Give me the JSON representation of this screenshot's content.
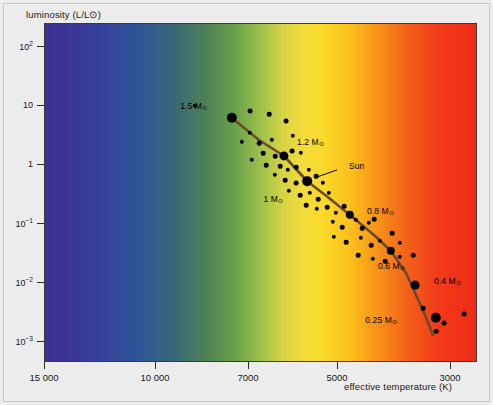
{
  "figure": {
    "y_axis_title": "luminosity (L/L⊙)",
    "x_axis_title": "effective temperature (K)"
  },
  "chart_data": {
    "type": "scatter",
    "title": "",
    "subtitle": "",
    "xlabel": "effective temperature (K)",
    "ylabel": "luminosity (L/L⊙)",
    "xscale": "log-reversed",
    "yscale": "log",
    "xlim": [
      15000,
      2600
    ],
    "ylim": [
      0.001,
      300
    ],
    "grid": false,
    "legend": null,
    "background": "stellar color spectrum gradient (blue hot -> red cool)",
    "xticks": [
      {
        "value": 15000,
        "label": "15 000"
      },
      {
        "value": 10000,
        "label": "10 000"
      },
      {
        "value": 7000,
        "label": "7000"
      },
      {
        "value": 5000,
        "label": "5000"
      },
      {
        "value": 3000,
        "label": "3000"
      }
    ],
    "yticks": [
      {
        "value": 100,
        "label": "10",
        "exponent": "2"
      },
      {
        "value": 10,
        "label": "10",
        "exponent": ""
      },
      {
        "value": 1,
        "label": "1",
        "exponent": ""
      },
      {
        "value": 0.1,
        "label": "10",
        "exponent": "−1"
      },
      {
        "value": 0.01,
        "label": "10",
        "exponent": "−2"
      },
      {
        "value": 0.001,
        "label": "10",
        "exponent": "−3"
      }
    ],
    "series": [
      {
        "name": "main sequence track",
        "type": "line",
        "color": "#6b4a2a",
        "points": [
          {
            "px": 188,
            "py": 95
          },
          {
            "px": 215,
            "py": 117
          },
          {
            "px": 240,
            "py": 133
          },
          {
            "px": 263,
            "py": 158
          },
          {
            "px": 285,
            "py": 175
          },
          {
            "px": 306,
            "py": 192
          },
          {
            "px": 330,
            "py": 212
          },
          {
            "px": 347,
            "py": 228
          },
          {
            "px": 362,
            "py": 250
          },
          {
            "px": 372,
            "py": 272
          },
          {
            "px": 381,
            "py": 292
          },
          {
            "px": 389,
            "py": 312
          }
        ]
      },
      {
        "name": "mass markers",
        "type": "scatter",
        "color": "#000000",
        "points": [
          {
            "label": "1.5 M⊙",
            "mass": 1.5,
            "px": 188,
            "py": 95,
            "r": 5.2
          },
          {
            "label": "1.2 M⊙",
            "mass": 1.2,
            "px": 240,
            "py": 133,
            "r": 4.6
          },
          {
            "label": "Sun",
            "mass": 1.0,
            "px": 263,
            "py": 158,
            "r": 4.8
          },
          {
            "label": "1 M⊙",
            "mass": 1.0,
            "px": 263,
            "py": 158,
            "r": 0
          },
          {
            "label": "0.8 M⊙",
            "mass": 0.8,
            "px": 306,
            "py": 192,
            "r": 4.2
          },
          {
            "label": "0.6 M⊙",
            "mass": 0.6,
            "px": 347,
            "py": 228,
            "r": 4.2
          },
          {
            "label": "0.4 M⊙",
            "mass": 0.4,
            "px": 371,
            "py": 262,
            "r": 4.4
          },
          {
            "label": "0.25 M⊙",
            "mass": 0.25,
            "px": 392,
            "py": 295,
            "r": 5.2
          }
        ]
      },
      {
        "name": "observed stars",
        "type": "scatter",
        "color": "#000000",
        "points": [
          {
            "px": 206,
            "py": 88,
            "r": 2.4
          },
          {
            "px": 225,
            "py": 91,
            "r": 2.3
          },
          {
            "px": 242,
            "py": 98,
            "r": 2.4
          },
          {
            "px": 206,
            "py": 110,
            "r": 2.2
          },
          {
            "px": 198,
            "py": 119,
            "r": 2.2
          },
          {
            "px": 215,
            "py": 120,
            "r": 2.3
          },
          {
            "px": 228,
            "py": 117,
            "r": 2.2
          },
          {
            "px": 249,
            "py": 113,
            "r": 2.2
          },
          {
            "px": 219,
            "py": 130,
            "r": 2.3
          },
          {
            "px": 231,
            "py": 133,
            "r": 2.3
          },
          {
            "px": 248,
            "py": 128,
            "r": 2.4
          },
          {
            "px": 257,
            "py": 130,
            "r": 2.2
          },
          {
            "px": 208,
            "py": 137,
            "r": 2.2
          },
          {
            "px": 222,
            "py": 142,
            "r": 2.3
          },
          {
            "px": 236,
            "py": 143,
            "r": 2.3
          },
          {
            "px": 244,
            "py": 147,
            "r": 2.2
          },
          {
            "px": 252,
            "py": 144,
            "r": 2.3
          },
          {
            "px": 231,
            "py": 152,
            "r": 2.2
          },
          {
            "px": 241,
            "py": 157,
            "r": 2.3
          },
          {
            "px": 252,
            "py": 160,
            "r": 2.4
          },
          {
            "px": 265,
            "py": 147,
            "r": 2.2
          },
          {
            "px": 272,
            "py": 153,
            "r": 2.3
          },
          {
            "px": 279,
            "py": 160,
            "r": 2.2
          },
          {
            "px": 245,
            "py": 168,
            "r": 2.2
          },
          {
            "px": 256,
            "py": 172,
            "r": 2.3
          },
          {
            "px": 266,
            "py": 170,
            "r": 2.2
          },
          {
            "px": 274,
            "py": 176,
            "r": 2.3
          },
          {
            "px": 285,
            "py": 170,
            "r": 2.2
          },
          {
            "px": 262,
            "py": 182,
            "r": 2.3
          },
          {
            "px": 273,
            "py": 186,
            "r": 2.2
          },
          {
            "px": 283,
            "py": 184,
            "r": 2.3
          },
          {
            "px": 292,
            "py": 190,
            "r": 2.2
          },
          {
            "px": 300,
            "py": 183,
            "r": 2.3
          },
          {
            "px": 289,
            "py": 199,
            "r": 2.2
          },
          {
            "px": 298,
            "py": 204,
            "r": 2.3
          },
          {
            "px": 312,
            "py": 197,
            "r": 2.2
          },
          {
            "px": 318,
            "py": 205,
            "r": 2.3
          },
          {
            "px": 325,
            "py": 200,
            "r": 2.2
          },
          {
            "px": 330,
            "py": 196,
            "r": 2.3
          },
          {
            "px": 290,
            "py": 214,
            "r": 2.2
          },
          {
            "px": 302,
            "py": 219,
            "r": 2.3
          },
          {
            "px": 317,
            "py": 215,
            "r": 2.2
          },
          {
            "px": 327,
            "py": 222,
            "r": 2.3
          },
          {
            "px": 336,
            "py": 218,
            "r": 2.2
          },
          {
            "px": 348,
            "py": 210,
            "r": 2.3
          },
          {
            "px": 356,
            "py": 220,
            "r": 2.2
          },
          {
            "px": 314,
            "py": 232,
            "r": 2.3
          },
          {
            "px": 329,
            "py": 236,
            "r": 2.2
          },
          {
            "px": 341,
            "py": 238,
            "r": 2.3
          },
          {
            "px": 356,
            "py": 234,
            "r": 2.2
          },
          {
            "px": 369,
            "py": 232,
            "r": 2.3
          },
          {
            "px": 379,
            "py": 285,
            "r": 2.3
          },
          {
            "px": 400,
            "py": 300,
            "r": 2.4
          },
          {
            "px": 392,
            "py": 308,
            "r": 2.3
          },
          {
            "px": 420,
            "py": 291,
            "r": 2.4
          },
          {
            "px": 151,
            "py": 83,
            "r": 2.2
          }
        ]
      }
    ],
    "annotations": [
      {
        "text": "1.5 M⊙",
        "px": 163,
        "py": 83,
        "anchor": "end"
      },
      {
        "text": "1.2 M⊙",
        "px": 253,
        "py": 119,
        "anchor": "start"
      },
      {
        "text": "Sun",
        "px": 305,
        "py": 143,
        "anchor": "start",
        "leader": {
          "x1": 293,
          "y1": 147,
          "x2": 270,
          "y2": 155
        }
      },
      {
        "text": "1 M⊙",
        "px": 239,
        "py": 176,
        "anchor": "end"
      },
      {
        "text": "0.8 M⊙",
        "px": 323,
        "py": 188,
        "anchor": "start"
      },
      {
        "text": "0.6 M⊙",
        "px": 334,
        "py": 243,
        "anchor": "start"
      },
      {
        "text": "0.4 M⊙",
        "px": 390,
        "py": 258,
        "anchor": "start"
      },
      {
        "text": "0.25 M⊙",
        "px": 353,
        "py": 297,
        "anchor": "end"
      }
    ]
  }
}
